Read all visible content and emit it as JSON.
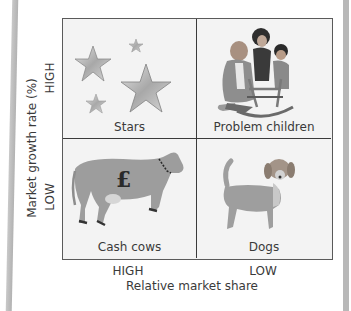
{
  "axes": {
    "y_title": "Market growth rate (%)",
    "y_high": "HIGH",
    "y_low": "LOW",
    "x_title": "Relative market share",
    "x_high": "HIGH",
    "x_low": "LOW"
  },
  "quadrants": [
    {
      "position": "top-left",
      "label": "Stars",
      "icon": "stars-icon",
      "growth": "HIGH",
      "share": "HIGH"
    },
    {
      "position": "top-right",
      "label": "Problem children",
      "icon": "family-rocking-horse-icon",
      "growth": "HIGH",
      "share": "LOW"
    },
    {
      "position": "bottom-left",
      "label": "Cash cows",
      "icon": "cow-with-pound-icon",
      "growth": "LOW",
      "share": "HIGH",
      "symbol": "£"
    },
    {
      "position": "bottom-right",
      "label": "Dogs",
      "icon": "dog-icon",
      "growth": "LOW",
      "share": "LOW"
    }
  ],
  "colors": {
    "border": "#3a3a3a",
    "cell_bg": "#f3f3f3",
    "illustration": "#9a9a9a",
    "text": "#3a3a3a",
    "side_bar": "#b8b8b8"
  }
}
